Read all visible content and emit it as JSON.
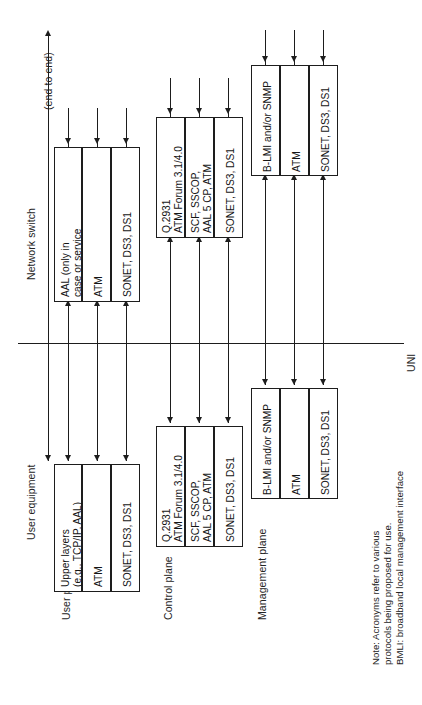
{
  "diagram": {
    "side_labels": {
      "network_switch": "Network switch",
      "user_equipment": "User equipment",
      "end_to_end": "(end to end)",
      "uni": "UNI"
    },
    "plane_labels": {
      "user_plane": "User plane",
      "control_plane": "Control plane",
      "management_plane": "Management plane"
    },
    "stacks": {
      "switch_user_plane": {
        "layers": [
          "AAL (only in\ncase or service\ninterworking)",
          "ATM",
          "SONET, DS3, DS1"
        ]
      },
      "switch_control_plane": {
        "layers": [
          "Q.2931\nATM Forum 3.1/4.0",
          "SCF, SSCOP,\nAAL 5 CP, ATM",
          "SONET, DS3, DS1"
        ]
      },
      "switch_management_plane": {
        "layers": [
          "B-LMI and/or SNMP",
          "ATM",
          "SONET, DS3, DS1"
        ]
      },
      "user_user_plane": {
        "layers": [
          "Upper layers\n(e.g., TCP/IP, AAL)",
          "ATM",
          "SONET, DS3, DS1"
        ]
      },
      "user_control_plane": {
        "layers": [
          "Q.2931\nATM Forum 3.1/4.0",
          "SCF, SSCOP,\nAAL 5 CP, ATM",
          "SONET, DS3, DS1"
        ]
      },
      "user_management_plane": {
        "layers": [
          "B-LMI and/or SNMP",
          "ATM",
          "SONET, DS3, DS1"
        ]
      }
    },
    "note": {
      "line1": "Note: Acronyms refer to various",
      "line2": "protocols being proposed for use.",
      "line3": "BMLI: broadband local management interface"
    },
    "colors": {
      "ink": "#1d1d1d",
      "background": "#ffffff"
    }
  }
}
